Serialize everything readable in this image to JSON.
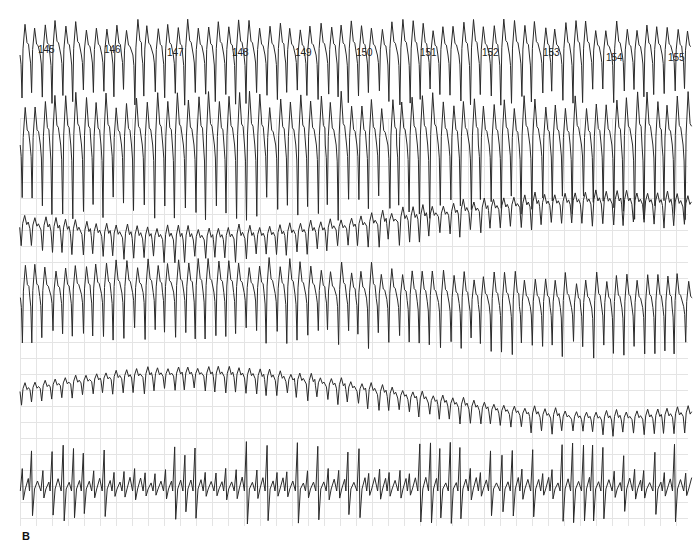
{
  "chart_data": {
    "type": "line",
    "title": "",
    "panel_label": "B",
    "beat_labels": [
      {
        "text": "145",
        "x": 38
      },
      {
        "text": "146",
        "x": 104
      },
      {
        "text": "147",
        "x": 167
      },
      {
        "text": "148",
        "x": 232
      },
      {
        "text": "149",
        "x": 295
      },
      {
        "text": "150",
        "x": 356
      },
      {
        "text": "151",
        "x": 420
      },
      {
        "text": "152",
        "x": 482
      },
      {
        "text": "153",
        "x": 543
      },
      {
        "text": "154",
        "x": 606
      },
      {
        "text": "155",
        "x": 668
      }
    ],
    "grid": {
      "on": true,
      "cell_px": 16,
      "color": "#e4e4e4"
    },
    "series": [
      {
        "name": "lead-1",
        "baseline": 55,
        "amp": 30,
        "morph": "wide-negative",
        "beats_per_label": 6.2,
        "drift": 0
      },
      {
        "name": "lead-2",
        "baseline": 145,
        "amp": 45,
        "morph": "wide-negative",
        "beats_per_label": 6.2,
        "drift": 0
      },
      {
        "name": "lead-3",
        "baseline": 222,
        "amp": 14,
        "morph": "small",
        "beats_per_label": 6.2,
        "drift": 18
      },
      {
        "name": "lead-4",
        "baseline": 300,
        "amp": 30,
        "morph": "wide-negative",
        "beats_per_label": 6.2,
        "drift": -8
      },
      {
        "name": "lead-5",
        "baseline": 398,
        "amp": 10,
        "morph": "small",
        "beats_per_label": 6.2,
        "drift": -22
      },
      {
        "name": "lead-6",
        "baseline": 485,
        "amp": 28,
        "morph": "irregular-positive",
        "beats_per_label": 6.2,
        "drift": 0
      }
    ],
    "line_color": "#2a2a2a",
    "xrange": [
      20,
      688
    ]
  }
}
